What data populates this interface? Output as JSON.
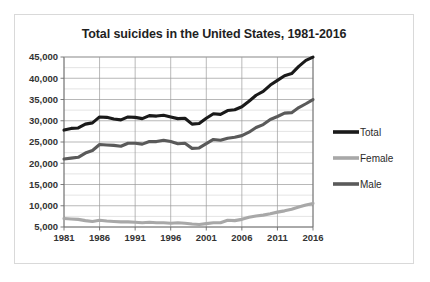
{
  "chart_data": {
    "type": "line",
    "title": "Total suicides in the United States, 1981-2016",
    "xlabel": "",
    "ylabel": "",
    "xlim": [
      1981,
      2016
    ],
    "ylim": [
      5000,
      45000
    ],
    "ytick_step": 5000,
    "yminor_step": 2500,
    "xtick_step": 5,
    "grid": true,
    "legend_position": "right",
    "ytick_labels": [
      "5,000",
      "10,000",
      "15,000",
      "20,000",
      "25,000",
      "30,000",
      "35,000",
      "40,000",
      "45,000"
    ],
    "ytick_values": [
      5000,
      10000,
      15000,
      20000,
      25000,
      30000,
      35000,
      40000,
      45000
    ],
    "xtick_labels": [
      "1981",
      "1986",
      "1991",
      "1996",
      "2001",
      "2006",
      "2011",
      "2016"
    ],
    "xtick_values": [
      1981,
      1986,
      1991,
      1996,
      2001,
      2006,
      2011,
      2016
    ],
    "x": [
      1981,
      1982,
      1983,
      1984,
      1985,
      1986,
      1987,
      1988,
      1989,
      1990,
      1991,
      1992,
      1993,
      1994,
      1995,
      1996,
      1997,
      1998,
      1999,
      2000,
      2001,
      2002,
      2003,
      2004,
      2005,
      2006,
      2007,
      2008,
      2009,
      2010,
      2011,
      2012,
      2013,
      2014,
      2015,
      2016
    ],
    "series": [
      {
        "name": "Total",
        "color": "#1a1a1a",
        "width": 3.1,
        "values": [
          27800,
          28200,
          28300,
          29200,
          29500,
          30900,
          30800,
          30400,
          30200,
          30900,
          30800,
          30500,
          31200,
          31100,
          31300,
          30900,
          30500,
          30600,
          29200,
          29350,
          30600,
          31650,
          31500,
          32400,
          32600,
          33300,
          34600,
          36000,
          36900,
          38400,
          39500,
          40600,
          41100,
          42800,
          44200,
          44960
        ],
        "endpoints": {
          "1981": 27800,
          "2016": 44960
        }
      },
      {
        "name": "Female",
        "color": "#a8a8a8",
        "width": 3.1,
        "values": [
          7000,
          6900,
          6800,
          6500,
          6300,
          6600,
          6400,
          6300,
          6200,
          6200,
          6100,
          6000,
          6100,
          6000,
          6000,
          5900,
          6000,
          5900,
          5700,
          5600,
          5800,
          6000,
          6000,
          6600,
          6500,
          6800,
          7300,
          7600,
          7800,
          8100,
          8500,
          8800,
          9200,
          9700,
          10200,
          10550
        ],
        "endpoints": {
          "1981": 7000,
          "2016": 10550
        }
      },
      {
        "name": "Male",
        "color": "#5a5a5a",
        "width": 3.1,
        "values": [
          21000,
          21200,
          21400,
          22400,
          23000,
          24400,
          24300,
          24200,
          24000,
          24700,
          24700,
          24500,
          25100,
          25100,
          25400,
          25100,
          24600,
          24700,
          23500,
          23600,
          24600,
          25600,
          25400,
          25900,
          26100,
          26500,
          27300,
          28400,
          29100,
          30300,
          31000,
          31800,
          31900,
          33100,
          34000,
          34970
        ],
        "endpoints": {
          "1981": 21000,
          "2016": 34970
        }
      }
    ],
    "legend_entries": [
      {
        "label": "Total",
        "color": "#1a1a1a"
      },
      {
        "label": "Female",
        "color": "#a8a8a8"
      },
      {
        "label": "Male",
        "color": "#5a5a5a"
      }
    ]
  }
}
